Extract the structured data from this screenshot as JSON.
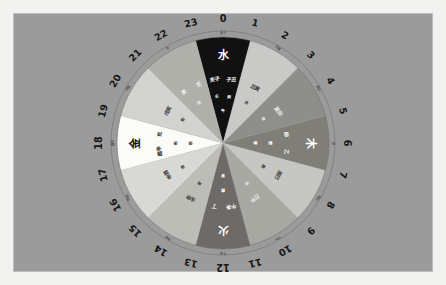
{
  "figure": {
    "kind": "wuxing-24h-wheel",
    "background_color": "#9b9b9b",
    "frame_color": "#f2f2f0",
    "ring_line_color": "#6f6f6f"
  },
  "hour_ring": {
    "label": "24-hour ring",
    "hours": [
      "0",
      "1",
      "2",
      "3",
      "4",
      "5",
      "6",
      "7",
      "8",
      "9",
      "10",
      "11",
      "12",
      "13",
      "14",
      "15",
      "16",
      "17",
      "18",
      "19",
      "20",
      "21",
      "22",
      "23"
    ]
  },
  "chart_data": {
    "type": "pie",
    "title": "",
    "xlabel": "",
    "ylabel": "",
    "legend": "none",
    "grid": false,
    "categories": [
      "水",
      "?",
      "木",
      "?",
      "?",
      "火",
      "?",
      "?",
      "金",
      "?",
      "?",
      "?"
    ],
    "values": [
      1,
      1,
      1,
      1,
      1,
      1,
      1,
      1,
      1,
      1,
      1,
      1
    ],
    "sector_count": 12,
    "sector_span_degrees": 30,
    "start_hour": 23,
    "sectors": [
      {
        "index": 0,
        "hour_center": 0,
        "element": "水",
        "color": "#111111",
        "text_color": "#ffffff",
        "labels": [
          "亥子",
          "子丑"
        ],
        "sub": [
          "壬",
          "癸"
        ],
        "tip": "冬"
      },
      {
        "index": 1,
        "hour_center": 2,
        "element": "",
        "color": "#c9c9c7",
        "text_color": "#3a3a3a",
        "labels": [
          "丑寅"
        ],
        "sub": [
          "艮"
        ],
        "tip": ""
      },
      {
        "index": 2,
        "hour_center": 4,
        "element": "",
        "color": "#8e8e8a",
        "text_color": "#f0f0f0",
        "labels": [
          "寅卯"
        ],
        "sub": [
          "甲"
        ],
        "tip": ""
      },
      {
        "index": 3,
        "hour_center": 6,
        "element": "木",
        "color": "#7f7f78",
        "text_color": "#ffffff",
        "labels": [
          "卯",
          "乙"
        ],
        "sub": [
          "震"
        ],
        "tip": "春"
      },
      {
        "index": 4,
        "hour_center": 8,
        "element": "",
        "color": "#c6c6c2",
        "text_color": "#3a3a3a",
        "labels": [
          "辰巳"
        ],
        "sub": [
          "巽"
        ],
        "tip": ""
      },
      {
        "index": 5,
        "hour_center": 10,
        "element": "",
        "color": "#a8a8a2",
        "text_color": "#f0f0f0",
        "labels": [
          "巳午"
        ],
        "sub": [
          "丙"
        ],
        "tip": ""
      },
      {
        "index": 6,
        "hour_center": 12,
        "element": "火",
        "color": "#6e6a68",
        "text_color": "#ffffff",
        "labels": [
          "午未",
          "丁"
        ],
        "sub": [
          "離"
        ],
        "tip": "夏"
      },
      {
        "index": 7,
        "hour_center": 14,
        "element": "",
        "color": "#bdbdb8",
        "text_color": "#3a3a3a",
        "labels": [
          "未申"
        ],
        "sub": [
          "坤"
        ],
        "tip": ""
      },
      {
        "index": 8,
        "hour_center": 16,
        "element": "",
        "color": "#d8d8d4",
        "text_color": "#3a3a3a",
        "labels": [
          "申酉"
        ],
        "sub": [
          "庚"
        ],
        "tip": ""
      },
      {
        "index": 9,
        "hour_center": 18,
        "element": "金",
        "color": "#fbfbf8",
        "text_color": "#1a1a1a",
        "labels": [
          "酉辛",
          "兌"
        ],
        "sub": [
          "秋"
        ],
        "tip": "秋"
      },
      {
        "index": 10,
        "hour_center": 20,
        "element": "",
        "color": "#d2d2ce",
        "text_color": "#3a3a3a",
        "labels": [
          "戌亥"
        ],
        "sub": [
          "乾"
        ],
        "tip": ""
      },
      {
        "index": 11,
        "hour_center": 22,
        "element": "",
        "color": "#b0b0ab",
        "text_color": "#f5f5f5",
        "labels": [
          "亥",
          "壬"
        ],
        "sub": [
          "坎"
        ],
        "tip": ""
      }
    ]
  }
}
